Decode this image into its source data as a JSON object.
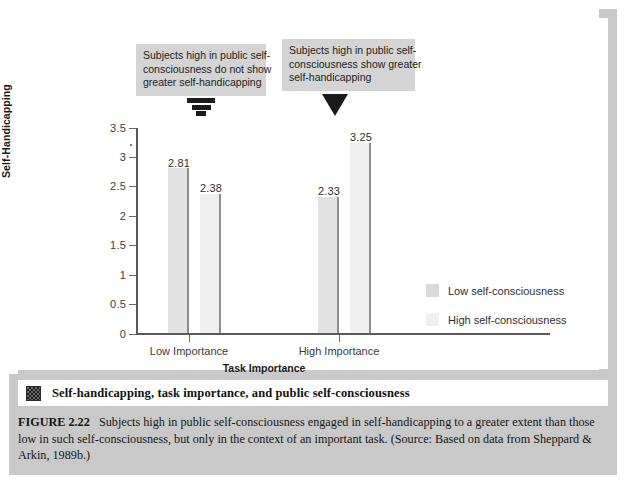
{
  "figure": {
    "title": "Self-handicapping, task importance, and public self-consciousness",
    "title_icon": "dither-square-icon",
    "caption_label": "FIGURE 2.22",
    "caption_text": "Subjects high in public self-consciousness engaged in self-handicapping to a greater extent than those low in such self-consciousness, but only in the context of an important task.  (Source: Based on data from Sheppard & Arkin, 1989b.)"
  },
  "callouts": [
    {
      "id": "callout-low",
      "lines": [
        "Subjects high in public self-",
        "consciousness do not show",
        "greater self-handicapping"
      ],
      "arrow": "segmented-down-triangle-icon"
    },
    {
      "id": "callout-high",
      "lines": [
        "Subjects high in public self-",
        "consciousness show greater",
        "self-handicapping"
      ],
      "arrow": "solid-down-triangle-icon"
    }
  ],
  "chart_data": {
    "type": "bar",
    "title": "",
    "xlabel": "Task Importance",
    "ylabel": "Self-Handicapping",
    "categories": [
      "Low Importance",
      "High Importance"
    ],
    "series": [
      {
        "name": "Low self-consciousness",
        "values": [
          2.81,
          2.33
        ],
        "color": "#e2e2e2"
      },
      {
        "name": "High self-consciousness",
        "values": [
          2.38,
          3.25
        ],
        "color": "#efefef"
      }
    ],
    "value_labels": [
      "2.81",
      "2.38",
      "2.33",
      "3.25"
    ],
    "ylim": [
      0,
      3.5
    ],
    "yticks": [
      0,
      0.5,
      1,
      1.5,
      2,
      2.5,
      3,
      3.5
    ],
    "ytick_labels": [
      "0",
      "0.5",
      "1",
      "1.5",
      "2",
      "2.5",
      "3",
      "3.5"
    ],
    "grid": false,
    "legend_position": "right"
  },
  "legend": [
    {
      "label": "Low self-consciousness",
      "swatch": "low"
    },
    {
      "label": "High self-consciousness",
      "swatch": "high"
    }
  ]
}
